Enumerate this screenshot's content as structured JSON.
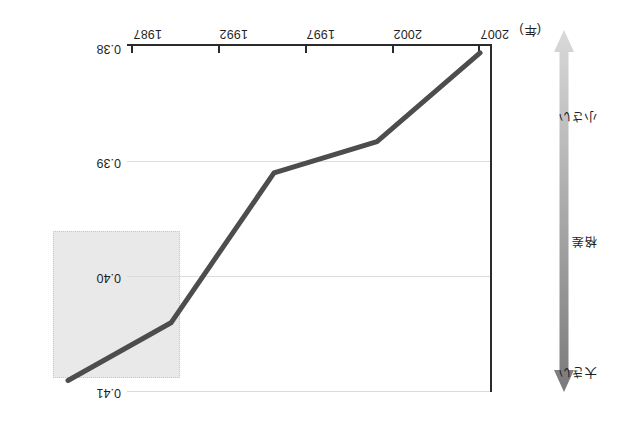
{
  "chart_data": {
    "type": "line",
    "title": "",
    "subtitle": "",
    "xlabel": "年",
    "ylabel": "",
    "x": [
      "1987",
      "1992",
      "1997",
      "2002",
      "2007"
    ],
    "categories": [
      "1987",
      "1992",
      "1997",
      "2002",
      "2007"
    ],
    "values": [
      0.3806,
      0.3883,
      0.391,
      0.404,
      0.409
    ],
    "series": [
      {
        "name": "格差指標",
        "values": [
          0.3806,
          0.3883,
          0.391,
          0.404,
          0.409
        ]
      }
    ],
    "ylim": [
      0.41,
      0.38
    ],
    "y_ticks": [
      "0.41",
      "0.40",
      "0.39",
      "0.38"
    ],
    "y_tick_values": [
      0.41,
      0.4,
      0.39,
      0.38
    ],
    "y_axis_inverted": true,
    "grid": true,
    "grid_axis": "y",
    "legend": "none",
    "line_color": "#4d4d4d",
    "annotation_box": {
      "label": "",
      "x_range": [
        "2002",
        "2007"
      ],
      "fill_color": "#e9e9e9",
      "border_style": "dotted"
    },
    "gradient_legend": {
      "top_label": "小さい",
      "middle_label": "格差",
      "bottom_label": "大きい",
      "direction": "double-headed-vertical",
      "top_color": "#d9d9d9",
      "bottom_color": "#808080"
    },
    "orientation_note": "figure rendered rotated 180 degrees"
  },
  "axis": {
    "x_tick_labels": [
      "1987",
      "1992",
      "1997",
      "2002",
      "2007"
    ],
    "x_unit_label": "(年)",
    "x_last_label": "2007",
    "y_tick_labels": [
      "0.41",
      "0.40",
      "0.39",
      "0.38"
    ]
  },
  "legend": {
    "small_label": "小さい",
    "middle_label": "格差",
    "large_label": "大きい"
  },
  "colors": {
    "line": "#4d4d4d",
    "axis": "#2b2b2b",
    "grid": "#dcdcdc",
    "highlight_fill": "#e9e9e9",
    "gradient_light": "#d9d9d9",
    "gradient_dark": "#808080"
  }
}
